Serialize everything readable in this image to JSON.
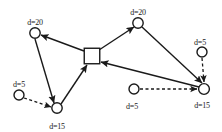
{
  "diagram": {
    "type": "node-link-graph",
    "title": "",
    "canvas": {
      "width": 222,
      "height": 132,
      "background": "#ffffff"
    },
    "style": {
      "stroke_color": "#1a1a1a",
      "node_fill": "#ffffff",
      "solid_stroke_width": 1.4,
      "dashed_stroke_width": 1.3,
      "dash_pattern": "3,2.5",
      "label_font_size": 8
    },
    "nodes": [
      {
        "id": "n1",
        "shape": "circle",
        "cx": 35,
        "cy": 33,
        "r": 5.2,
        "label": "d=20",
        "label_x": 35,
        "label_y": 19,
        "role": "demand-node"
      },
      {
        "id": "n2",
        "shape": "circle",
        "cx": 138,
        "cy": 23,
        "r": 5.2,
        "label": "d=20",
        "label_x": 138,
        "label_y": 9,
        "role": "demand-node"
      },
      {
        "id": "hub",
        "shape": "square",
        "cx": 92,
        "cy": 56,
        "size": 15.5,
        "label": "",
        "label_x": 92,
        "label_y": 56,
        "role": "depot-node"
      },
      {
        "id": "n3",
        "shape": "circle",
        "cx": 19,
        "cy": 95,
        "r": 5.0,
        "label": "d=5",
        "label_x": 19,
        "label_y": 81,
        "role": "demand-node"
      },
      {
        "id": "n4",
        "shape": "circle",
        "cx": 57,
        "cy": 108,
        "r": 5.2,
        "label": "d=15",
        "label_x": 57,
        "label_y": 123,
        "role": "demand-node"
      },
      {
        "id": "n5",
        "shape": "circle",
        "cx": 202,
        "cy": 52,
        "r": 5.0,
        "label": "d=5",
        "label_x": 200,
        "label_y": 39,
        "role": "demand-node"
      },
      {
        "id": "n6",
        "shape": "circle",
        "cx": 204,
        "cy": 89,
        "r": 5.4,
        "label": "d=15",
        "label_x": 202,
        "label_y": 102,
        "role": "demand-node"
      },
      {
        "id": "n7",
        "shape": "circle",
        "cx": 134,
        "cy": 89,
        "r": 5.0,
        "label": "d=5",
        "label_x": 132,
        "label_y": 103,
        "role": "demand-node"
      }
    ],
    "edges": [
      {
        "id": "e1",
        "from": "hub",
        "to": "n1",
        "style": "solid",
        "arrow": true,
        "x1": 84,
        "y1": 51,
        "x2": 41,
        "y2": 35
      },
      {
        "id": "e2",
        "from": "hub",
        "to": "n2",
        "style": "solid",
        "arrow": true,
        "x1": 99,
        "y1": 50,
        "x2": 134,
        "y2": 27
      },
      {
        "id": "e3",
        "from": "n4",
        "to": "hub",
        "style": "solid",
        "arrow": true,
        "x1": 61,
        "y1": 104,
        "x2": 87,
        "y2": 65
      },
      {
        "id": "e4",
        "from": "n6",
        "to": "hub",
        "style": "solid",
        "arrow": true,
        "x1": 199,
        "y1": 87,
        "x2": 101,
        "y2": 62
      },
      {
        "id": "e5",
        "from": "n1",
        "to": "n4",
        "style": "solid",
        "arrow": true,
        "x1": 35,
        "y1": 39,
        "x2": 54,
        "y2": 103
      },
      {
        "id": "e6",
        "from": "n2",
        "to": "n6",
        "style": "solid",
        "arrow": true,
        "x1": 142,
        "y1": 27,
        "x2": 202,
        "y2": 83
      },
      {
        "id": "e7",
        "from": "n3",
        "to": "n4",
        "style": "dashed",
        "arrow": true,
        "x1": 24,
        "y1": 98,
        "x2": 51,
        "y2": 107
      },
      {
        "id": "e8",
        "from": "n5",
        "to": "n6",
        "style": "dashed",
        "arrow": true,
        "x1": 202,
        "y1": 58,
        "x2": 204,
        "y2": 82
      },
      {
        "id": "e9",
        "from": "n7",
        "to": "n6",
        "style": "dashed",
        "arrow": true,
        "x1": 140,
        "y1": 89,
        "x2": 197,
        "y2": 89
      }
    ]
  }
}
